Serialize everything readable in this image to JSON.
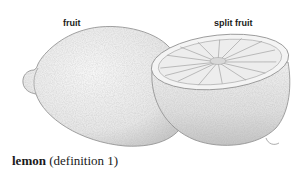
{
  "illustration": {
    "subject": "lemon",
    "labels": {
      "whole": "fruit",
      "split": "split fruit"
    }
  },
  "caption": {
    "term": "lemon",
    "note": "(definition 1)"
  }
}
